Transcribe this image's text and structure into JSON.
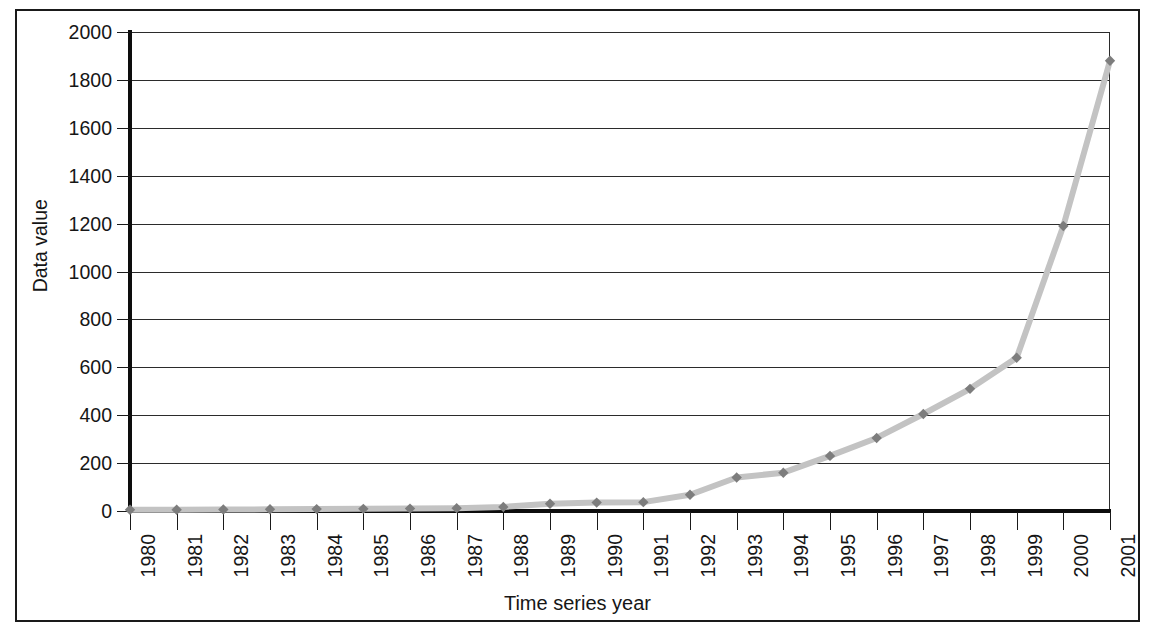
{
  "chart_data": {
    "type": "line",
    "title": "",
    "subtitle": "",
    "xlabel": "Time series year",
    "ylabel": "Data value",
    "categories": [
      "1980",
      "1981",
      "1982",
      "1983",
      "1984",
      "1985",
      "1986",
      "1987",
      "1988",
      "1989",
      "1990",
      "1991",
      "1992",
      "1993",
      "1994",
      "1995",
      "1996",
      "1997",
      "1998",
      "1999",
      "2000",
      "2001"
    ],
    "values": [
      5,
      5,
      6,
      7,
      8,
      9,
      10,
      12,
      17,
      30,
      35,
      37,
      68,
      140,
      160,
      230,
      305,
      405,
      510,
      640,
      1190,
      1880
    ],
    "series": [
      {
        "name": "Data value",
        "values": [
          5,
          5,
          6,
          7,
          8,
          9,
          10,
          12,
          17,
          30,
          35,
          37,
          68,
          140,
          160,
          230,
          305,
          405,
          510,
          640,
          1190,
          1880
        ],
        "line_color": "#c3c3c3",
        "marker_color": "#7d7d7d",
        "marker": "diamond"
      }
    ],
    "ylim": [
      0,
      2000
    ],
    "ytick_step": 200,
    "yticks": [
      0,
      200,
      400,
      600,
      800,
      1000,
      1200,
      1400,
      1600,
      1800,
      2000
    ],
    "ytick_labels": [
      "0",
      "200",
      "400",
      "600",
      "800",
      "1000",
      "1200",
      "1400",
      "1600",
      "1800",
      "2000"
    ],
    "xtick_labels_rotation": 90,
    "grid": {
      "horizontal": true,
      "vertical": false
    },
    "legend": {
      "visible": false,
      "position": "none"
    },
    "frame": {
      "outer_border": true,
      "border_color": "#1a1a1a"
    },
    "axis_color": "#0d0d0d",
    "gridline_color": "#2b2b2b",
    "background_color": "#ffffff"
  }
}
